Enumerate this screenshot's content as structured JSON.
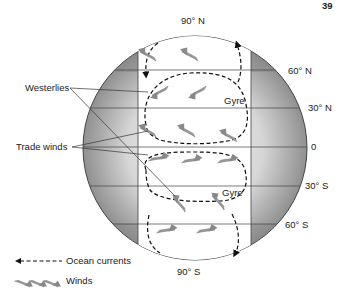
{
  "header": {
    "page_number": "39"
  },
  "diagram": {
    "latitudes": [
      {
        "label": "90° N",
        "y": 26
      },
      {
        "label": "60° N",
        "y": 70
      },
      {
        "label": "30° N",
        "y": 108
      },
      {
        "label": "0",
        "y": 147
      },
      {
        "label": "30° S",
        "y": 186
      },
      {
        "label": "60° S",
        "y": 224
      },
      {
        "label": "90° S",
        "y": 272
      }
    ],
    "callouts": {
      "westerlies": "Westerlies",
      "trade_winds": "Trade winds"
    },
    "gyre_labels": {
      "north": "Gyre",
      "south": "Gyre"
    },
    "colors": {
      "shade_dark": "#8a8a8a",
      "shade_light": "#f2f2f2",
      "outline": "#444444",
      "arrow": "#888888",
      "current": "#111111"
    }
  },
  "legend": {
    "ocean_currents": "Ocean currents",
    "winds": "Winds"
  }
}
